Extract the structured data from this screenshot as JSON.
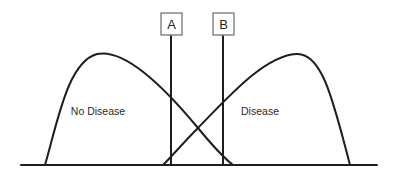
{
  "diagram": {
    "type": "overlapping-distributions-with-thresholds",
    "distributions": [
      {
        "id": "no-disease",
        "label": "No Disease"
      },
      {
        "id": "disease",
        "label": "Disease"
      }
    ],
    "thresholds": [
      {
        "id": "A",
        "label": "A"
      },
      {
        "id": "B",
        "label": "B"
      }
    ],
    "colors": {
      "line": "#1e1e1e",
      "box_border": "#6a6a6a",
      "background": "#ffffff"
    }
  }
}
